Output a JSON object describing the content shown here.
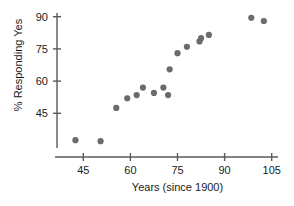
{
  "chart_data": {
    "type": "scatter",
    "title": "",
    "xlabel": "Years (since 1900)",
    "ylabel": "% Responding Yes",
    "xticks": [
      45,
      60,
      75,
      90,
      105
    ],
    "yticks": [
      45,
      60,
      75,
      90
    ],
    "xlim": [
      37,
      108
    ],
    "ylim": [
      28,
      94
    ],
    "grid": false,
    "legend": null,
    "marker_color": "#6b6b6b",
    "axis_color": "#5a5a5a",
    "points": [
      {
        "x": 42.5,
        "y": 32.5
      },
      {
        "x": 50.5,
        "y": 32.0
      },
      {
        "x": 55.5,
        "y": 47.5
      },
      {
        "x": 59.0,
        "y": 52.0
      },
      {
        "x": 62.0,
        "y": 53.5
      },
      {
        "x": 64.0,
        "y": 57.0
      },
      {
        "x": 67.5,
        "y": 54.5
      },
      {
        "x": 70.5,
        "y": 57.0
      },
      {
        "x": 72.0,
        "y": 53.5
      },
      {
        "x": 72.5,
        "y": 65.5
      },
      {
        "x": 75.0,
        "y": 73.0
      },
      {
        "x": 78.0,
        "y": 76.0
      },
      {
        "x": 82.0,
        "y": 78.5
      },
      {
        "x": 82.5,
        "y": 80.0
      },
      {
        "x": 85.0,
        "y": 81.5
      },
      {
        "x": 98.5,
        "y": 89.5
      },
      {
        "x": 102.5,
        "y": 88.0
      }
    ]
  },
  "axis_titles": {
    "x": "Years (since 1900)",
    "y": "% Responding Yes"
  }
}
